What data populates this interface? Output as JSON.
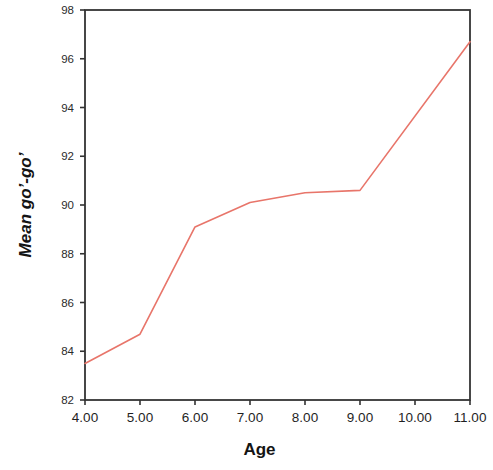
{
  "figure": {
    "background_color": "#ffffff",
    "axis_color": "#333333",
    "text_color": "#141414"
  },
  "chart_data": {
    "type": "line",
    "title": "",
    "xlabel": "Age",
    "ylabel": "Mean go’-go’",
    "x": [
      4,
      5,
      6,
      7,
      8,
      9,
      11
    ],
    "values": [
      83.5,
      84.7,
      89.1,
      90.1,
      90.5,
      90.6,
      96.7
    ],
    "series": [
      {
        "name": "Mean go’-go’",
        "color": "#e8756a",
        "values": [
          83.5,
          84.7,
          89.1,
          90.1,
          90.5,
          90.6,
          96.7
        ]
      }
    ],
    "xlim": [
      4,
      11
    ],
    "ylim": [
      82,
      98
    ],
    "xticks": [
      4,
      5,
      6,
      7,
      8,
      9,
      10,
      11
    ],
    "xtick_labels": [
      "4.00",
      "5.00",
      "6.00",
      "7.00",
      "8.00",
      "9.00",
      "10.00",
      "11.00"
    ],
    "yticks": [
      82,
      84,
      86,
      88,
      90,
      92,
      94,
      96,
      98
    ],
    "ytick_labels": [
      "82",
      "84",
      "86",
      "88",
      "90",
      "92",
      "94",
      "96",
      "98"
    ],
    "grid": false,
    "legend": false,
    "markers": false,
    "line_color": "#e8756a",
    "line_width": 1.6
  }
}
